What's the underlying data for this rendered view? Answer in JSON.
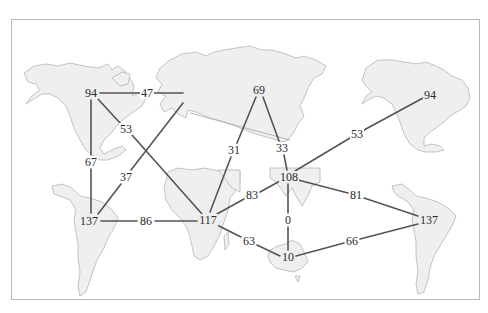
{
  "diagram": {
    "type": "world-map-graph",
    "colors": {
      "land_fill": "#efefef",
      "land_stroke": "#b5b5b5",
      "edge": "#555555",
      "frame": "#b9b9b9",
      "background": "#ffffff"
    },
    "nodes": [
      {
        "id": "na_west",
        "label": "94",
        "x": 91,
        "y": 93
      },
      {
        "id": "europe_w",
        "label": "47",
        "x": 147,
        "y": 93
      },
      {
        "id": "atl_n",
        "label": "53",
        "x": 126,
        "y": 129
      },
      {
        "id": "na_sa_link",
        "label": "67",
        "x": 91,
        "y": 162
      },
      {
        "id": "atl_s",
        "label": "37",
        "x": 126,
        "y": 177
      },
      {
        "id": "sa_west",
        "label": "137",
        "x": 89,
        "y": 221
      },
      {
        "id": "atl_mid",
        "label": "86",
        "x": 146,
        "y": 221
      },
      {
        "id": "africa",
        "label": "117",
        "x": 208,
        "y": 220
      },
      {
        "id": "mideast",
        "label": "31",
        "x": 234,
        "y": 150
      },
      {
        "id": "siberia",
        "label": "69",
        "x": 259,
        "y": 90
      },
      {
        "id": "central_asia",
        "label": "33",
        "x": 282,
        "y": 148
      },
      {
        "id": "india",
        "label": "108",
        "x": 289,
        "y": 177
      },
      {
        "id": "indian_ocean_n",
        "label": "83",
        "x": 252,
        "y": 195
      },
      {
        "id": "indonesia",
        "label": "0",
        "x": 288,
        "y": 220
      },
      {
        "id": "indian_ocean_s",
        "label": "63",
        "x": 249,
        "y": 241
      },
      {
        "id": "australia",
        "label": "10",
        "x": 288,
        "y": 257
      },
      {
        "id": "pacific_s",
        "label": "66",
        "x": 352,
        "y": 241
      },
      {
        "id": "pacific_m",
        "label": "81",
        "x": 356,
        "y": 195
      },
      {
        "id": "sa_east",
        "label": "137",
        "x": 429,
        "y": 220
      },
      {
        "id": "pacific_n",
        "label": "53",
        "x": 357,
        "y": 134
      },
      {
        "id": "na_east",
        "label": "94",
        "x": 430,
        "y": 95
      }
    ],
    "edges": [
      {
        "from": "na_west",
        "to": "europe_w"
      },
      {
        "from": "na_west",
        "to": "atl_n"
      },
      {
        "from": "atl_n",
        "to": "africa"
      },
      {
        "from": "na_west",
        "to": "na_sa_link"
      },
      {
        "from": "na_sa_link",
        "to": "sa_west"
      },
      {
        "from": "sa_west",
        "to": "atl_s"
      },
      {
        "from": "atl_s",
        "to": "europe_w"
      },
      {
        "from": "sa_west",
        "to": "atl_mid"
      },
      {
        "from": "atl_mid",
        "to": "africa"
      },
      {
        "from": "africa",
        "to": "mideast"
      },
      {
        "from": "mideast",
        "to": "siberia"
      },
      {
        "from": "siberia",
        "to": "central_asia"
      },
      {
        "from": "central_asia",
        "to": "india"
      },
      {
        "from": "india",
        "to": "pacific_n"
      },
      {
        "from": "pacific_n",
        "to": "na_east"
      },
      {
        "from": "india",
        "to": "indian_ocean_n"
      },
      {
        "from": "indian_ocean_n",
        "to": "africa"
      },
      {
        "from": "india",
        "to": "indonesia"
      },
      {
        "from": "indonesia",
        "to": "australia"
      },
      {
        "from": "africa",
        "to": "indian_ocean_s"
      },
      {
        "from": "indian_ocean_s",
        "to": "australia"
      },
      {
        "from": "india",
        "to": "pacific_m"
      },
      {
        "from": "pacific_m",
        "to": "sa_east"
      },
      {
        "from": "australia",
        "to": "pacific_s"
      },
      {
        "from": "pacific_s",
        "to": "sa_east"
      }
    ],
    "labels": {
      "na_west": "94",
      "europe_w": "47",
      "atl_n": "53",
      "na_sa_link": "67",
      "atl_s": "37",
      "sa_west": "137",
      "atl_mid": "86",
      "africa": "117",
      "mideast": "31",
      "siberia": "69",
      "central_asia": "33",
      "india": "108",
      "indian_ocean_n": "83",
      "indonesia": "0",
      "indian_ocean_s": "63",
      "australia": "10",
      "pacific_s": "66",
      "pacific_m": "81",
      "sa_east": "137",
      "pacific_n": "53",
      "na_east": "94"
    }
  }
}
